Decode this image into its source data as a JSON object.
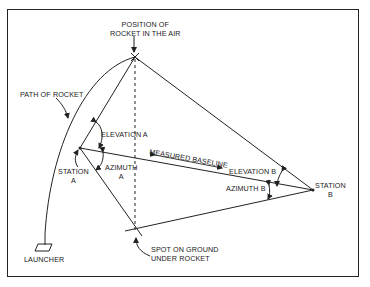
{
  "labels": {
    "rocket_position_line1": "POSITION OF",
    "rocket_position_line2": "ROCKET IN THE AIR",
    "path_of_rocket": "PATH OF ROCKET",
    "elevation_a": "ELEVATION A",
    "station_a_line1": "STATION",
    "station_a_line2": "A",
    "azimuth_a_line1": "AZIMUTH",
    "azimuth_a_line2": "A",
    "measured_baseline": "MEASURED BASELINE",
    "elevation_b": "ELEVATION B",
    "azimuth_b": "AZIMUTH B",
    "station_b_line1": "STATION",
    "station_b_line2": "B",
    "spot_line1": "SPOT ON GROUND",
    "spot_line2": "UNDER ROCKET",
    "launcher": "LAUNCHER"
  },
  "colors": {
    "line": "#222222",
    "background": "#ffffff"
  }
}
